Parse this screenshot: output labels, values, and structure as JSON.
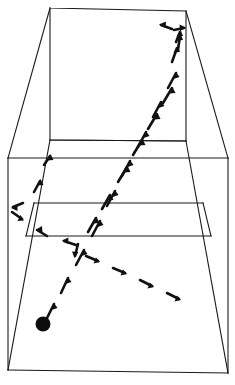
{
  "diagram": {
    "type": "perspective-line-drawing",
    "view": "rear three-quarter perspective of an enclosed court",
    "canvas": {
      "width": 235,
      "height": 385
    },
    "colors": {
      "background": "#ffffff",
      "line": "#1a1a1a",
      "trajectory": "#111111",
      "ball": "#0d0d0d"
    },
    "court": {
      "name": "court-outline",
      "description": "Enclosed four-wall court drawn in one-point perspective with back wall, two side walls and floor",
      "back_wall": {
        "name": "back-wall",
        "points": [
          [
            50,
            8
          ],
          [
            186,
            11
          ],
          [
            186,
            141
          ],
          [
            50,
            140
          ]
        ]
      },
      "left_wall": {
        "name": "left-wall",
        "points": [
          [
            50,
            8
          ],
          [
            50,
            140
          ],
          [
            8,
            370
          ],
          [
            8,
            158
          ],
          [
            14,
            152
          ]
        ]
      },
      "right_wall": {
        "name": "right-wall",
        "points": [
          [
            186,
            11
          ],
          [
            186,
            141
          ],
          [
            228,
            373
          ],
          [
            228,
            158
          ],
          [
            222,
            152
          ]
        ]
      },
      "floor": {
        "name": "court-floor",
        "points": [
          [
            8,
            158
          ],
          [
            228,
            158
          ],
          [
            228,
            373
          ],
          [
            8,
            370
          ]
        ]
      },
      "lines": [
        {
          "name": "back-wall-base-line",
          "points": [
            [
              50,
              140
            ],
            [
              186,
              141
            ]
          ]
        },
        {
          "name": "floor-back-line",
          "points": [
            [
              8,
              158
            ],
            [
              228,
              158
            ]
          ]
        },
        {
          "name": "short-line",
          "points": [
            [
              34,
              203
            ],
            [
              203,
              203
            ]
          ]
        },
        {
          "name": "service-box-front-line",
          "points": [
            [
              26,
              236
            ],
            [
              211,
              236
            ]
          ]
        },
        {
          "name": "service-box-left-line",
          "points": [
            [
              34,
              203
            ],
            [
              26,
              236
            ]
          ]
        },
        {
          "name": "service-box-right-line",
          "points": [
            [
              203,
              203
            ],
            [
              211,
              236
            ]
          ]
        },
        {
          "name": "floor-front-line",
          "points": [
            [
              8,
              370
            ],
            [
              228,
              373
            ]
          ]
        },
        {
          "name": "left-wall-floor-edge",
          "points": [
            [
              50,
              140
            ],
            [
              8,
              370
            ]
          ]
        },
        {
          "name": "right-wall-floor-edge",
          "points": [
            [
              186,
              141
            ],
            [
              228,
              373
            ]
          ]
        },
        {
          "name": "left-wall-top-edge",
          "points": [
            [
              50,
              8
            ],
            [
              8,
              158
            ]
          ]
        },
        {
          "name": "right-wall-top-edge",
          "points": [
            [
              186,
              11
            ],
            [
              228,
              158
            ]
          ]
        }
      ]
    },
    "trajectories": [
      {
        "name": "serve-path-outgoing",
        "label": "Ball path from player to front wall",
        "style": "dashed-arrow-chain",
        "direction": "up-right",
        "dash_count": 9,
        "from": [
          48,
          318
        ],
        "to": [
          181,
          22
        ]
      },
      {
        "name": "rebound-path-upper",
        "label": "Rebound path rising to the upper right corner",
        "style": "dashed-arrow-chain",
        "direction": "up-right",
        "dash_count": 6,
        "from": [
          109,
          225
        ],
        "to": [
          178,
          33
        ]
      },
      {
        "name": "return-path-descending",
        "label": "Descending return path across the floor to the right",
        "style": "dashed-arrow-chain",
        "direction": "down-right",
        "dash_count": 6,
        "from": [
          63,
          243
        ],
        "to": [
          181,
          302
        ]
      },
      {
        "name": "side-wall-bounce-path",
        "label": "Short V-shaped bounce against the left side wall",
        "style": "dashed-arrow-chain",
        "direction": "v-bounce",
        "dash_count": 4,
        "from": [
          46,
          178
        ],
        "to": [
          20,
          216
        ]
      }
    ],
    "markers": [
      {
        "name": "ball-marker",
        "label": "Ball position",
        "shape": "filled-circle",
        "cx": 43,
        "cy": 324,
        "r": 7.5,
        "color": "#0d0d0d"
      }
    ]
  }
}
